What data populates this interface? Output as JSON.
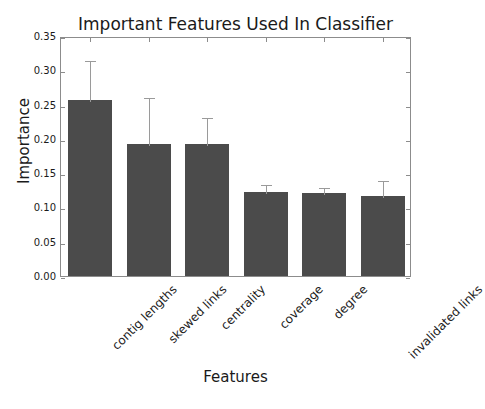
{
  "chart_data": {
    "type": "bar",
    "title": "Important Features Used In Classifier",
    "xlabel": "Features",
    "ylabel": "Importance",
    "categories": [
      "contig lengths",
      "skewed links",
      "centrality",
      "coverage",
      "degree",
      "invalidated links"
    ],
    "values": [
      0.256,
      0.193,
      0.193,
      0.123,
      0.121,
      0.117
    ],
    "errors_upper": [
      0.061,
      0.07,
      0.041,
      0.012,
      0.01,
      0.025
    ],
    "error_tops": [
      0.317,
      0.263,
      0.234,
      0.135,
      0.131,
      0.142
    ],
    "ylim": [
      0.0,
      0.35
    ],
    "yticks": [
      0.0,
      0.05,
      0.1,
      0.15,
      0.2,
      0.25,
      0.3,
      0.35
    ],
    "ytick_labels": [
      "0.00",
      "0.05",
      "0.10",
      "0.15",
      "0.20",
      "0.25",
      "0.30",
      "0.35"
    ],
    "grid": false,
    "legend": null,
    "bar_color": "#4b4b4b",
    "error_color": "#9a9a9a",
    "axis_color": "#8c8c8c",
    "xtick_rotation": 45
  }
}
